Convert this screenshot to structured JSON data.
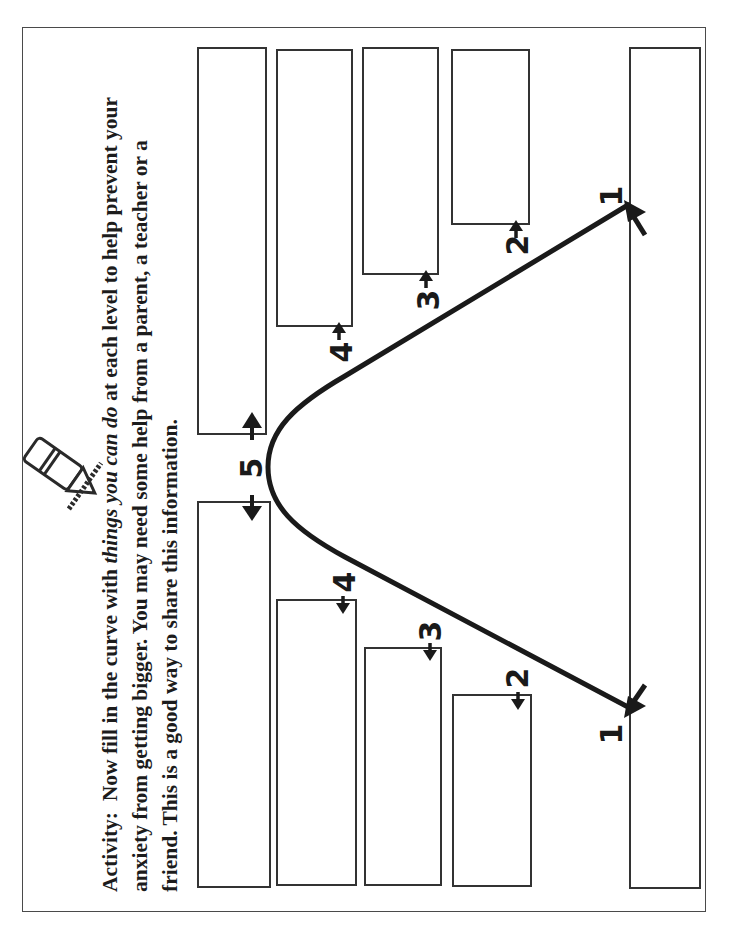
{
  "activity": {
    "label": "Activity:",
    "line1_pre": "Now fill in the curve with ",
    "line1_em": "things you can do",
    "line1_post": " at each level to help prevent your",
    "line2": "anxiety from getting bigger.  You may need some help from a parent, a teacher or a",
    "line3": "friend.  This is a good way to share this information."
  },
  "icon": {
    "name": "pencil-icon"
  },
  "curve": {
    "orientation": "rotated 90 degrees counter-clockwise",
    "peak_level": "5",
    "levels_rising": [
      "1",
      "2",
      "3",
      "4",
      "5"
    ],
    "levels_falling": [
      "4",
      "3",
      "2",
      "1"
    ]
  },
  "boxes": {
    "rising_side": [
      {
        "level": "1",
        "content": ""
      },
      {
        "level": "2",
        "content": ""
      },
      {
        "level": "3",
        "content": ""
      },
      {
        "level": "4",
        "content": ""
      },
      {
        "level": "5",
        "content": ""
      }
    ],
    "falling_side": [
      {
        "level": "5",
        "content": ""
      },
      {
        "level": "4",
        "content": ""
      },
      {
        "level": "3",
        "content": ""
      },
      {
        "level": "2",
        "content": ""
      }
    ]
  },
  "labels": {
    "l1_top": "1",
    "l1_bottom": "1",
    "l2_top": "2",
    "l2_bottom": "2",
    "l3_top": "3",
    "l3_bottom": "3",
    "l4_top": "4",
    "l4_bottom": "4",
    "l5": "5"
  },
  "colors": {
    "ink": "#1a1a1a",
    "border": "#4a4a4a",
    "background": "#ffffff"
  }
}
